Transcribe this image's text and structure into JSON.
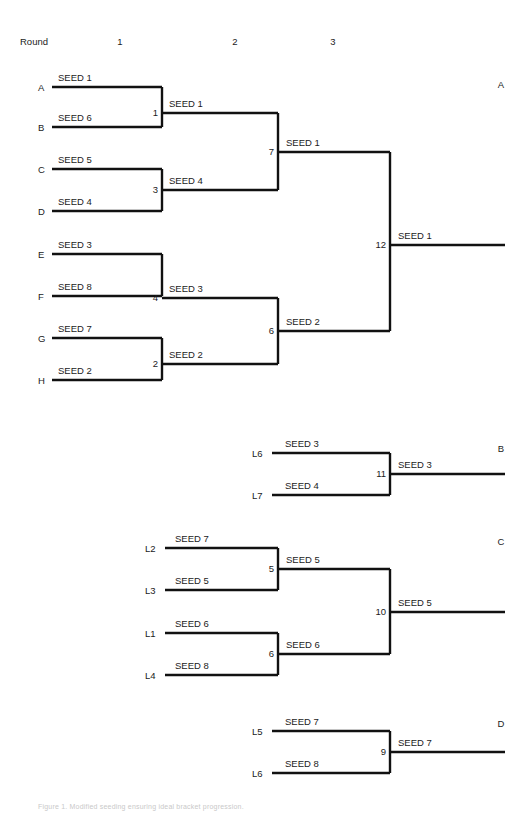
{
  "page": {
    "width": 532,
    "height": 817,
    "background": "#ffffff",
    "line_color": "#111111",
    "text_color": "#1b1b1b",
    "caption": "Figure 1.   Modified seeding ensuring ideal bracket progression."
  },
  "header": {
    "round_label": "Round",
    "rounds": [
      "1",
      "2",
      "3"
    ]
  },
  "winners_bracket": {
    "group_label": "A",
    "entrants": [
      {
        "slot": "A",
        "seed": "SEED 1"
      },
      {
        "slot": "B",
        "seed": "SEED 6"
      },
      {
        "slot": "C",
        "seed": "SEED 5"
      },
      {
        "slot": "D",
        "seed": "SEED 4"
      },
      {
        "slot": "E",
        "seed": "SEED 3"
      },
      {
        "slot": "F",
        "seed": "SEED 8"
      },
      {
        "slot": "G",
        "seed": "SEED 7"
      },
      {
        "slot": "H",
        "seed": "SEED 2"
      }
    ],
    "round1": [
      {
        "game": "1",
        "winner": "SEED 1"
      },
      {
        "game": "3",
        "winner": "SEED 4"
      },
      {
        "game": "4",
        "winner": "SEED 3"
      },
      {
        "game": "2",
        "winner": "SEED 2"
      }
    ],
    "round2": [
      {
        "game": "7",
        "winner": "SEED 1"
      },
      {
        "game": "6",
        "winner": "SEED 2"
      }
    ],
    "round3": [
      {
        "game": "12",
        "winner": "SEED 1"
      }
    ]
  },
  "bracket_b": {
    "group_label": "B",
    "entrants": [
      {
        "slot": "L6",
        "seed": "SEED 3"
      },
      {
        "slot": "L7",
        "seed": "SEED 4"
      }
    ],
    "games": [
      {
        "game": "11",
        "winner": "SEED 3"
      }
    ]
  },
  "bracket_c": {
    "group_label": "C",
    "entrants": [
      {
        "slot": "L2",
        "seed": "SEED 7"
      },
      {
        "slot": "L3",
        "seed": "SEED 5"
      },
      {
        "slot": "L1",
        "seed": "SEED 6"
      },
      {
        "slot": "L4",
        "seed": "SEED 8"
      }
    ],
    "round1": [
      {
        "game": "5",
        "winner": "SEED 5"
      },
      {
        "game": "6",
        "winner": "SEED 6"
      }
    ],
    "round2": [
      {
        "game": "10",
        "winner": "SEED 5"
      }
    ]
  },
  "bracket_d": {
    "group_label": "D",
    "entrants": [
      {
        "slot": "L5",
        "seed": "SEED 7"
      },
      {
        "slot": "L6",
        "seed": "SEED 8"
      }
    ],
    "games": [
      {
        "game": "9",
        "winner": "SEED 7"
      }
    ]
  }
}
